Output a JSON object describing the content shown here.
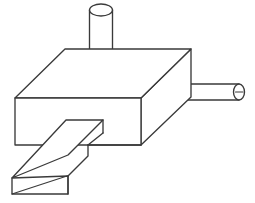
{
  "drawing": {
    "title": "Isometric line drawing of a machined block assembly",
    "background_color": "#ffffff",
    "line_color": "#3a3a3a",
    "line_width": 1.35,
    "canvas": {
      "width": 255,
      "height": 203
    },
    "projection": "isometric-oblique",
    "parts": [
      {
        "name": "base-block",
        "label": "Rectangular base block",
        "shape": "rectangular-prism",
        "top_face_points": "15,98 65,49 191,49 141,98",
        "front_face_points": "15,98 141,98 141,145 15,145",
        "right_face_points": "141,98 191,49 191,97 141,145",
        "vertices": {
          "top_left": "15,98",
          "top_back_left": "65,49",
          "top_back_right": "191,49",
          "top_front_right": "141,98",
          "bottom_front_left": "15,145",
          "bottom_front_right": "141,145",
          "bottom_back_right": "191,97"
        }
      },
      {
        "name": "vertical-cylinder",
        "label": "Vertical cylinder boss on top face",
        "shape": "cylinder",
        "axis": "vertical",
        "top_ellipse": {
          "cx": 101,
          "cy": 10,
          "rx": 11.5,
          "ry": 6
        },
        "body": {
          "left_x": 89.5,
          "right_x": 112.5,
          "top_y": 10,
          "bottom_y": 72
        },
        "bottom_arc_end_y": 79
      },
      {
        "name": "horizontal-cylinder",
        "label": "Horizontal cylinder pin protruding to the right",
        "shape": "cylinder",
        "axis": "horizontal",
        "body": {
          "left_x": 164,
          "right_x": 239,
          "top_y": 84,
          "bottom_y": 100
        },
        "left_cap_radius": 8,
        "right_ellipse": {
          "cx": 239,
          "cy": 92,
          "rx": 5.5,
          "ry": 8
        },
        "center_mark": {
          "x1": 235.5,
          "y1": 92,
          "x2": 243,
          "y2": 92
        }
      },
      {
        "name": "rectangular-bar",
        "label": "Rectangular bar extending to the lower left",
        "shape": "rectangular-prism",
        "top_face_points": "103,120 68,155 12,178 66,120",
        "front_face_points": "12,178 12,194 68,194 68,176",
        "end_face_points": "12,178 68,176 68,194 12,194",
        "diagonal_mark": {
          "x1": 12,
          "y1": 194,
          "x2": 67,
          "y2": 176
        },
        "vertices": {
          "inner_top_right": "103,120",
          "inner_top_left": "66,120",
          "outer_top_near": "68,176",
          "outer_top_far": "12,178",
          "outer_bottom_far": "12,194",
          "outer_bottom_near": "68,194",
          "lower_side_junction": "88,145"
        }
      }
    ]
  }
}
